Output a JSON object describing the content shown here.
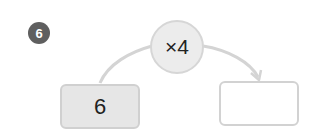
{
  "problem": {
    "number": "6"
  },
  "operation": {
    "label": "×4"
  },
  "input_box": {
    "value": "6"
  },
  "output_box": {
    "value": ""
  },
  "colors": {
    "badge": "#5f5f5f",
    "circle_fill": "#ececec",
    "circle_border": "#d6d6d6",
    "input_fill": "#e6e6e6",
    "line": "#d4d4d4"
  }
}
